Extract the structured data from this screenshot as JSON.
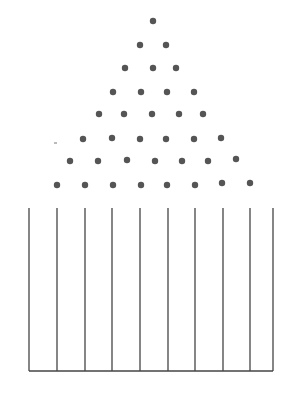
{
  "diagram": {
    "type": "galton-board",
    "title": "",
    "colors": {
      "peg": "#555555",
      "line": "#444444",
      "background": "#ffffff"
    },
    "peg_radius": 3.2,
    "peg_rows": [
      [
        [
          153,
          21
        ]
      ],
      [
        [
          140,
          45
        ],
        [
          166,
          45
        ]
      ],
      [
        [
          125,
          68
        ],
        [
          153,
          68
        ],
        [
          176,
          68
        ]
      ],
      [
        [
          113,
          92
        ],
        [
          141,
          92
        ],
        [
          167,
          92
        ],
        [
          194,
          92
        ]
      ],
      [
        [
          99,
          114
        ],
        [
          124,
          114
        ],
        [
          152,
          114
        ],
        [
          179,
          114
        ],
        [
          203,
          114
        ]
      ],
      [
        [
          83,
          139
        ],
        [
          112,
          138
        ],
        [
          140,
          139
        ],
        [
          166,
          139
        ],
        [
          194,
          139
        ],
        [
          221,
          138
        ]
      ],
      [
        [
          70,
          161
        ],
        [
          98,
          161
        ],
        [
          127,
          160
        ],
        [
          155,
          161
        ],
        [
          182,
          161
        ],
        [
          208,
          161
        ],
        [
          236,
          159
        ]
      ],
      [
        [
          57,
          185
        ],
        [
          85,
          185
        ],
        [
          113,
          185
        ],
        [
          141,
          185
        ],
        [
          167,
          185
        ],
        [
          195,
          185
        ],
        [
          222,
          183
        ],
        [
          250,
          183
        ]
      ]
    ],
    "bins": {
      "top_y": 208,
      "bottom_y": 371,
      "divider_x": [
        29,
        57,
        85,
        112,
        140,
        168,
        195,
        223,
        250,
        273
      ],
      "count": 9
    },
    "stray_mark": [
      54,
      143,
      57,
      143
    ]
  }
}
